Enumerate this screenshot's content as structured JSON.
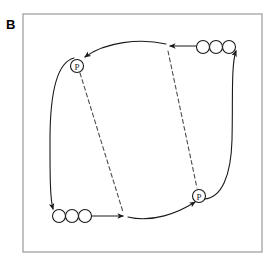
{
  "figure": {
    "panel_label": "B",
    "background_color": "#ffffff",
    "frame": {
      "name": "plot-frame",
      "x": 23,
      "y": 14,
      "width": 239,
      "height": 238,
      "stroke_color": "#9a9a9a",
      "stroke_width": 1.2,
      "fill": "none"
    },
    "stroke_color": "#1a1a1a",
    "dash_color": "#4d4d4d",
    "stroke_width": 1.1,
    "dash_pattern": "4 3"
  },
  "markers": [
    {
      "name": "p-marker-top-left",
      "label": "P",
      "cx": 77,
      "cy": 66,
      "r": 6.5
    },
    {
      "name": "p-marker-bottom-right",
      "label": "P",
      "cx": 199,
      "cy": 196,
      "r": 6.5
    }
  ],
  "circle_chains": [
    {
      "name": "circle-chain-top-right",
      "count": 3,
      "r": 6.5,
      "cy": 47,
      "cx_values": [
        203,
        216,
        229
      ]
    },
    {
      "name": "circle-chain-bottom-left",
      "count": 3,
      "r": 6.5,
      "cy": 216,
      "cx_values": [
        59,
        72,
        85
      ]
    }
  ],
  "paths": [
    {
      "name": "path-top-solid-arrow-to-p-top-left",
      "style": "solid",
      "d": "M 203 46 L 170 46",
      "arrow_at": "end"
    },
    {
      "name": "path-top-curve-to-p-top-left",
      "style": "solid",
      "d": "M 166 44 C 140 38 105 42 85 57",
      "arrow_at": "end"
    },
    {
      "name": "path-left-curve-down-to-circle-chain",
      "style": "solid",
      "d": "M 74 58 C 58 62 50 90 50 140 C 50 175 50 198 53 209",
      "arrow_at": "end"
    },
    {
      "name": "path-bottom-solid-arrow-right",
      "style": "solid",
      "d": "M 92 216 L 123 216",
      "arrow_at": "end"
    },
    {
      "name": "path-bottom-curve-to-p-bottom-right",
      "style": "solid",
      "d": "M 128 217 C 152 223 178 213 195 202",
      "arrow_at": "end"
    },
    {
      "name": "path-right-curve-up-to-circle-chain",
      "style": "solid",
      "d": "M 204 199 C 222 198 231 175 232 140 C 233 100 231 65 236 51",
      "arrow_at": "end"
    },
    {
      "name": "path-dashed-p-top-left-to-bottom",
      "style": "dashed",
      "d": "M 80 73 L 123 212",
      "arrow_at": "none"
    },
    {
      "name": "path-dashed-top-to-p-bottom-right",
      "style": "dashed",
      "d": "M 168 51 L 197 188",
      "arrow_at": "none"
    }
  ]
}
